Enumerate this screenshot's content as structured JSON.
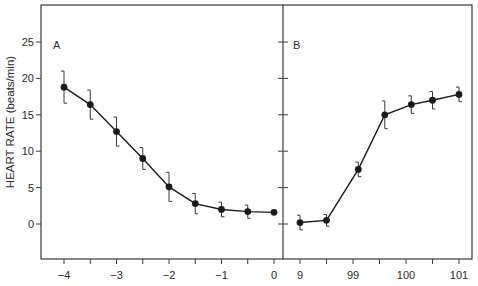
{
  "chart_data": {
    "type": "line",
    "ylabel": "HEART RATE (beats/min)",
    "ylim": [
      -5,
      30
    ],
    "yticks": [
      0,
      5,
      10,
      15,
      20,
      25
    ],
    "grid": false,
    "error_bars": true,
    "panels": [
      {
        "label": "A",
        "xlim": [
          -4.05,
          0.2
        ],
        "xticks": [
          -4,
          -3.5,
          -3,
          -2.5,
          -2,
          -1.5,
          -1,
          -0.5,
          0
        ],
        "xtick_labels": [
          "−4",
          "",
          "−3",
          "",
          "−2",
          "",
          "−1",
          "",
          "0"
        ],
        "series": [
          {
            "name": "A",
            "x": [
              -4,
              -3.5,
              -3,
              -2.5,
              -2,
              -1.5,
              -1,
              -0.5,
              0
            ],
            "y": [
              18.8,
              16.4,
              12.7,
              9.0,
              5.1,
              2.8,
              2.0,
              1.7,
              1.6
            ],
            "err": [
              2.2,
              2.0,
              2.0,
              1.5,
              2.0,
              1.4,
              1.0,
              0.9,
              0
            ]
          }
        ]
      },
      {
        "label": "B",
        "xlim": [
          97.7,
          101.25
        ],
        "xticks": [
          98,
          98.5,
          99,
          99.5,
          100,
          100.5,
          101
        ],
        "xtick_labels": [
          "9",
          "",
          "99",
          "",
          "100",
          "",
          "101"
        ],
        "series": [
          {
            "name": "B",
            "x": [
              98,
              98.5,
              99.1,
              99.6,
              100.1,
              100.5,
              101
            ],
            "y": [
              0.2,
              0.5,
              7.5,
              15.0,
              16.4,
              17.0,
              17.8
            ],
            "err": [
              1.0,
              0.8,
              1.0,
              1.9,
              1.2,
              1.2,
              1.0
            ]
          }
        ]
      }
    ]
  },
  "labels": {
    "ylabel": "HEART RATE (beats/min)",
    "panel_a": "A",
    "panel_b": "B"
  },
  "colors": {
    "axis": "#3a3a3a",
    "line": "#1a1a1a",
    "text": "#2a2a2a"
  }
}
